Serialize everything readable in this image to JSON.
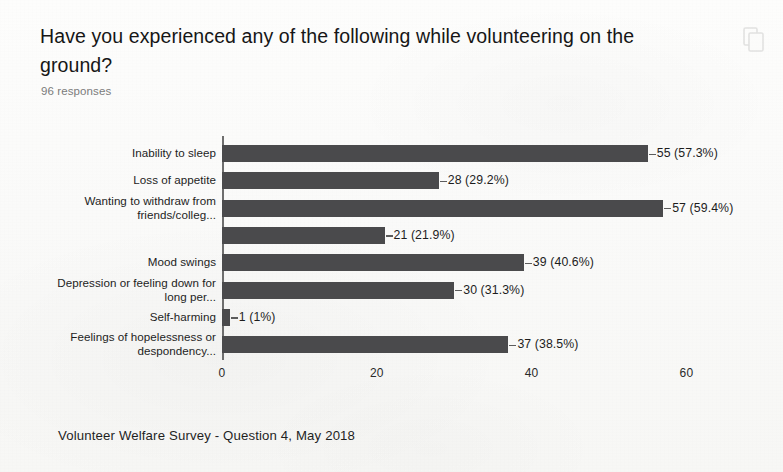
{
  "header": {
    "question_title": "Have you experienced any of the following while volunteering on the ground?",
    "responses_text": "96 responses",
    "copy_icon": "copy-icon"
  },
  "footer": {
    "caption": "Volunteer Welfare Survey - Question 4, May 2018"
  },
  "colors": {
    "bar_fill": "#4a4a4c",
    "axis": "#6e6e6e",
    "page_background": "#fbfbfa",
    "text": "#1d1d1d",
    "muted_text": "#7b7b7b"
  },
  "chart_data": {
    "type": "bar",
    "orientation": "horizontal",
    "title": "Have you experienced any of the following while volunteering on the ground?",
    "subtitle": "96 responses",
    "xlabel": "",
    "ylabel": "",
    "xlim": [
      0,
      62
    ],
    "xticks": [
      0,
      20,
      40,
      60
    ],
    "xtick_labels": [
      "0",
      "20",
      "40",
      "60"
    ],
    "grid": false,
    "legend": false,
    "total_responses": 96,
    "categories": [
      "Inability to sleep",
      "Loss of appetite",
      "Wanting to withdraw from friends/colleg...",
      "",
      "Mood swings",
      "Depression or feeling down for long per...",
      "Self-harming",
      "Feelings of hopelessness or despondency..."
    ],
    "values": [
      55,
      28,
      57,
      21,
      39,
      30,
      1,
      37
    ],
    "percent_labels": [
      "57.3%",
      "29.2%",
      "59.4%",
      "21.9%",
      "40.6%",
      "31.3%",
      "1%",
      "38.5%"
    ],
    "data_labels": [
      "55 (57.3%)",
      "28 (29.2%)",
      "57 (59.4%)",
      "21 (21.9%)",
      "39 (40.6%)",
      "30 (31.3%)",
      "1 (1%)",
      "37 (38.5%)"
    ],
    "category_lines": [
      [
        "Inability to sleep"
      ],
      [
        "Loss of appetite"
      ],
      [
        "Wanting to withdraw from",
        "friends/colleg..."
      ],
      [
        ""
      ],
      [
        "Mood swings"
      ],
      [
        "Depression or feeling down for",
        "long per..."
      ],
      [
        "Self-harming"
      ],
      [
        "Feelings of hopelessness or",
        "despondency..."
      ]
    ]
  }
}
